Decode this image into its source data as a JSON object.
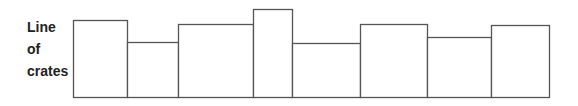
{
  "label": {
    "lines": [
      "Line",
      "of",
      "crates"
    ]
  },
  "diagram": {
    "stroke_color": "#555555",
    "baseline_y": 97,
    "crates": [
      {
        "x0": 73,
        "x1": 127,
        "top": 20
      },
      {
        "x0": 127,
        "x1": 178,
        "top": 42
      },
      {
        "x0": 178,
        "x1": 253,
        "top": 24
      },
      {
        "x0": 253,
        "x1": 292,
        "top": 9
      },
      {
        "x0": 292,
        "x1": 360,
        "top": 43
      },
      {
        "x0": 360,
        "x1": 427,
        "top": 24
      },
      {
        "x0": 427,
        "x1": 491,
        "top": 37
      },
      {
        "x0": 491,
        "x1": 549,
        "top": 25
      }
    ]
  }
}
